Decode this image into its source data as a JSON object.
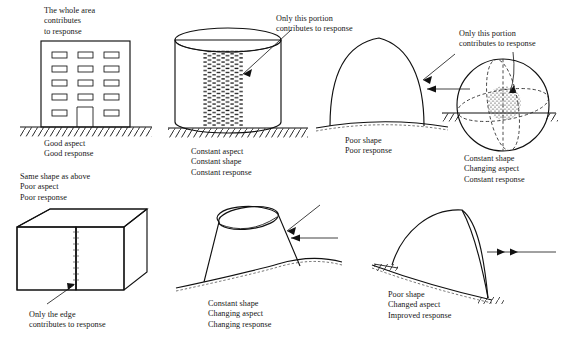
{
  "figure": {
    "background_color": "#ffffff",
    "ink_color": "#111111"
  },
  "panels": [
    {
      "id": "building",
      "shape_name": "rectangular-building",
      "annotation": "The whole area\ncontributes\nto response",
      "annotation_lines": [
        "The whole area",
        "contributes",
        "to response"
      ],
      "caption": "Good aspect\nGood response",
      "caption_lines": [
        "Good aspect",
        "Good response"
      ],
      "window_rows": 5,
      "window_cols": 3,
      "has_door": true,
      "ground": "hatched"
    },
    {
      "id": "cylinder",
      "shape_name": "upright-cylinder",
      "annotation": "Only this portion\ncontributes to response",
      "annotation_lines": [
        "Only this portion",
        "contributes to response"
      ],
      "caption": "Constant aspect\nConstant shape\nConstant response",
      "caption_lines": [
        "Constant aspect",
        "Constant shape",
        "Constant response"
      ],
      "highlight": "vertical-hatched-band",
      "ground": "hatched"
    },
    {
      "id": "dome",
      "shape_name": "pointed-dome",
      "annotation": "",
      "annotation_lines": [],
      "caption": "Poor shape\nPoor response",
      "caption_lines": [
        "Poor shape",
        "Poor response"
      ],
      "arrows": 2,
      "ground": "dashed-curve"
    },
    {
      "id": "sphere",
      "shape_name": "sphere",
      "annotation": "Only this portion\ncontributes to response",
      "annotation_lines": [
        "Only this portion",
        "contributes to response"
      ],
      "caption": "Constant shape\nChanging aspect\nConstant response",
      "caption_lines": [
        "Constant shape",
        "Changing aspect",
        "Constant response"
      ],
      "highlight": "stippled-patch",
      "ground": "hatched-split"
    },
    {
      "id": "cube",
      "shape_name": "cube",
      "annotation_top": "Same shape as above\nPoor aspect\nPoor response",
      "annotation_top_lines": [
        "Same shape as above",
        "Poor aspect",
        "Poor response"
      ],
      "annotation_bottom": "Only the edge\ncontributes to response",
      "annotation_bottom_lines": [
        "Only the edge",
        "contributes to response"
      ],
      "highlight": "front-vertical-edge"
    },
    {
      "id": "tilted-cylinder",
      "shape_name": "tilted-cylinder",
      "annotation": "",
      "annotation_lines": [],
      "caption": "Constant shape\nChanging aspect\nChanging response",
      "caption_lines": [
        "Constant shape",
        "Changing aspect",
        "Changing response"
      ],
      "arrows": 2,
      "ground": "dashed-curve"
    },
    {
      "id": "asymmetric-dome",
      "shape_name": "asymmetric-dome",
      "annotation": "",
      "annotation_lines": [],
      "caption": "Poor shape\nChanged aspect\nImproved response",
      "caption_lines": [
        "Poor shape",
        "Changed aspect",
        "Improved response"
      ],
      "arrows": 1,
      "ground": "dashed-curve"
    }
  ]
}
